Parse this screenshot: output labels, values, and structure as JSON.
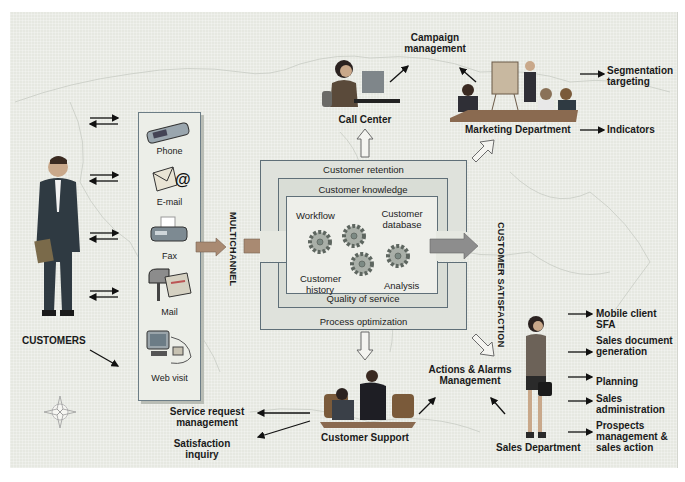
{
  "diagram": {
    "customers": {
      "label": "CUSTOMERS"
    },
    "channels": {
      "axis_label": "MULTICHANNEL",
      "items": [
        {
          "label": "Phone",
          "icon": "phone-icon"
        },
        {
          "label": "E-mail",
          "icon": "email-icon"
        },
        {
          "label": "Fax",
          "icon": "fax-icon"
        },
        {
          "label": "Mail",
          "icon": "mailbox-icon"
        },
        {
          "label": "Web visit",
          "icon": "computer-icon"
        }
      ]
    },
    "core": {
      "outer_top": "Customer retention",
      "outer_bottom": "Process optimization",
      "middle_top": "Customer knowledge",
      "middle_bottom": "Quality of service",
      "inner": {
        "workflow": "Workflow",
        "customer_database": "Customer database",
        "customer_history": "Customer history",
        "analysis": "Analysis"
      },
      "output_label": "CUSTOMER SATISFACTION"
    },
    "call_center": {
      "label": "Call Center"
    },
    "campaign": {
      "label": "Campaign management"
    },
    "marketing": {
      "label": "Marketing Department",
      "outputs": [
        "Segmentation targeting",
        "Indicators"
      ]
    },
    "customer_support": {
      "label": "Customer Support",
      "outputs": [
        "Service request management",
        "Satisfaction inquiry"
      ]
    },
    "actions": {
      "label": "Actions & Alarms Management"
    },
    "sales": {
      "label": "Sales Department",
      "outputs": [
        "Mobile client SFA",
        "Sales document generation",
        "Planning",
        "Sales administration",
        "Prospects management & sales action"
      ]
    }
  },
  "colors": {
    "background": "#e6e8e1",
    "frame_border": "#5f6f78",
    "big_arrow": "#a98a72",
    "hollow_arrow_stroke": "#6b6b6b"
  }
}
